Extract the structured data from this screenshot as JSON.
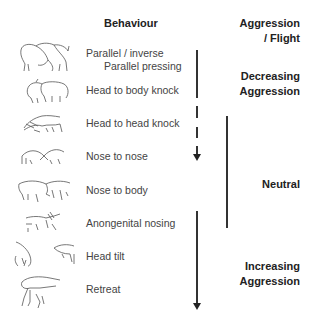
{
  "header": {
    "behaviour": "Behaviour",
    "category": "Aggression / Flight",
    "category_line1": "Aggression",
    "category_line2": "/ Flight"
  },
  "behaviours": [
    {
      "label_line1": "Parallel / inverse",
      "label_line2": "Parallel pressing",
      "icon": "pigs-parallel-pressing-icon"
    },
    {
      "label": "Head to body knock",
      "icon": "pigs-head-to-body-knock-icon"
    },
    {
      "label": "Head to head knock",
      "icon": "pigs-head-to-head-knock-icon"
    },
    {
      "label": "Nose to nose",
      "icon": "pigs-nose-to-nose-icon"
    },
    {
      "label": "Nose to body",
      "icon": "pigs-nose-to-body-icon"
    },
    {
      "label": "Anongenital nosing",
      "icon": "pigs-anogenital-nosing-icon"
    },
    {
      "label": "Head tilt",
      "icon": "pigs-head-tilt-icon"
    },
    {
      "label": "Retreat",
      "icon": "pig-retreat-icon"
    }
  ],
  "categories": {
    "decreasing": {
      "line1": "Decreasing",
      "line2": "Aggression"
    },
    "neutral": {
      "label": "Neutral"
    },
    "increasing": {
      "line1": "Increasing",
      "line2": "Aggression"
    }
  },
  "colors": {
    "text": "#444444",
    "heading": "#222222",
    "line": "#333333",
    "background": "#ffffff"
  }
}
